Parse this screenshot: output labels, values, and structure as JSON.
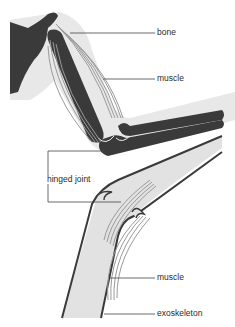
{
  "diagram": {
    "type": "anatomical comparison",
    "labels": {
      "bone": "bone",
      "muscle_upper": "muscle",
      "hinged_joint": "hinged joint",
      "muscle_lower": "muscle",
      "exoskeleton": "exoskeleton"
    },
    "colors": {
      "background": "#ffffff",
      "body_silhouette": "#e6e6e6",
      "bone": "#3a3a3a",
      "muscle": "#9a9a9a",
      "muscle_fill": "#cfcfcf",
      "exoskeleton_fill": "#e2e2e2",
      "exoskeleton_edge": "#3a3a3a",
      "leader_line": "#444444",
      "label_text": "#2a2a2a"
    }
  }
}
